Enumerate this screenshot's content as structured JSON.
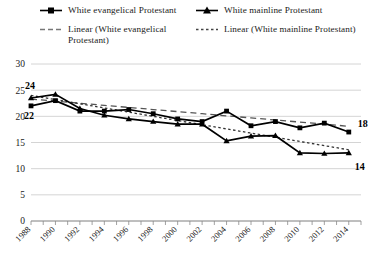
{
  "legend": {
    "entries": [
      {
        "label": "White evangelical Protestant",
        "key": "square-marker-solid-line",
        "style": "solid-square"
      },
      {
        "label": "White mainline Protestant",
        "key": "triangle-marker-solid-line",
        "style": "solid-triangle"
      },
      {
        "label": "Linear (White evangelical Protestant)",
        "key": "dashed-line",
        "style": "dashed"
      },
      {
        "label": "Linear (White mainline Protestant)",
        "key": "dotted-line",
        "style": "dotted"
      }
    ]
  },
  "chart_data": {
    "type": "line",
    "title": "",
    "subtitle": "",
    "xlabel": "",
    "ylabel": "",
    "xlim": [
      1988,
      2015
    ],
    "ylim": [
      0,
      30
    ],
    "yticks": [
      0,
      5,
      10,
      15,
      20,
      25,
      30
    ],
    "xticks": [
      1988,
      1990,
      1992,
      1994,
      1996,
      1998,
      2000,
      2002,
      2004,
      2006,
      2008,
      2010,
      2012,
      2014
    ],
    "xticklabels": [
      "1988",
      "1990",
      "1992",
      "1994",
      "1996",
      "1998",
      "2000",
      "2002",
      "2004",
      "2006",
      "2008",
      "2010",
      "2012",
      "2014"
    ],
    "grid": true,
    "legend_position": "top",
    "x": [
      1988,
      1990,
      1992,
      1994,
      1996,
      1998,
      2000,
      2002,
      2004,
      2006,
      2008,
      2010,
      2012,
      2014
    ],
    "series": [
      {
        "name": "White evangelical Protestant",
        "marker": "square",
        "line": "solid",
        "color": "#000000",
        "values": [
          22,
          23,
          21,
          21,
          21.3,
          20.5,
          19.5,
          19,
          21,
          18.2,
          19,
          17.8,
          18.7,
          17
        ]
      },
      {
        "name": "White mainline Protestant",
        "marker": "triangle",
        "line": "solid",
        "color": "#000000",
        "values": [
          23.5,
          24.2,
          21.5,
          20.2,
          19.5,
          19,
          18.5,
          18.5,
          15.3,
          16.2,
          16.3,
          13,
          12.9,
          13
        ]
      },
      {
        "name": "Linear (White evangelical Protestant)",
        "marker": "none",
        "line": "dashed",
        "color": "#555555",
        "values": [
          23.3,
          22.9,
          22.5,
          22.1,
          21.7,
          21.3,
          20.9,
          20.5,
          20.1,
          19.7,
          19.3,
          18.9,
          18.5,
          18.1
        ]
      },
      {
        "name": "Linear (White mainline Protestant)",
        "marker": "none",
        "line": "dotted",
        "color": "#333333",
        "values": [
          24.0,
          23.2,
          22.4,
          21.6,
          20.8,
          20.0,
          19.2,
          18.4,
          17.6,
          16.8,
          16.0,
          15.2,
          14.4,
          13.6
        ]
      }
    ],
    "point_labels": [
      {
        "text": "24",
        "series": "White mainline Protestant",
        "x": 1988,
        "position": "above-left"
      },
      {
        "text": "22",
        "series": "White evangelical Protestant",
        "x": 1988,
        "position": "below-left"
      },
      {
        "text": "18",
        "series": "White evangelical Protestant",
        "x": 2014,
        "position": "above-right"
      },
      {
        "text": "14",
        "series": "White mainline Protestant",
        "x": 2014,
        "position": "below-right"
      }
    ]
  }
}
